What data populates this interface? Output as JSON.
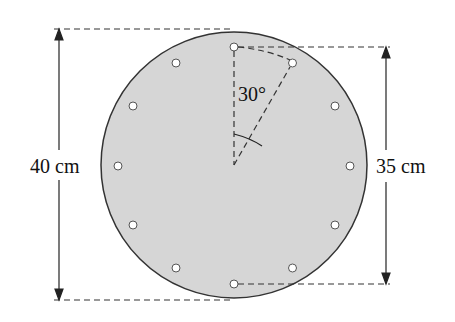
{
  "diagram": {
    "type": "clock-face geometry diagram",
    "labels": {
      "outer_diameter": "40 cm",
      "hole_circle_diameter": "35 cm",
      "angle": "30°"
    },
    "hole_count": 12,
    "colors": {
      "disc_fill": "#d6d6d6",
      "stroke": "#222222",
      "hole_fill": "#ffffff"
    }
  }
}
